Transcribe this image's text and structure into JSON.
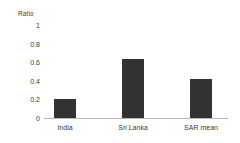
{
  "chart_data": {
    "type": "bar",
    "title": "",
    "subtitle": "",
    "xlabel": "",
    "ylabel": "Ratio",
    "categories": [
      "India",
      "Sri Lanka",
      "SAR mean"
    ],
    "values": [
      0.2,
      0.63,
      0.42
    ],
    "ylim": [
      0,
      1
    ],
    "yticks": [
      0,
      0.2,
      0.4,
      0.6,
      0.8,
      1
    ],
    "ytick_labels": [
      "0",
      "0.2",
      "0.4",
      "0.6",
      "0.8",
      "1"
    ],
    "grid": false,
    "legend": null,
    "legend_position": "none",
    "series": [
      {
        "name": "Ratio",
        "values": [
          0.2,
          0.63,
          0.42
        ]
      }
    ],
    "annotations": []
  },
  "style": {
    "bar_color": "#333333",
    "axis_color": "#b8b8b8",
    "text_color": "#3b3b3b",
    "background": "#ffffff"
  },
  "axis": {
    "y_title": "Ratio",
    "tick_0": "0",
    "tick_1": "0.2",
    "tick_2": "0.4",
    "tick_3": "0.6",
    "tick_4": "0.8",
    "tick_5": "1"
  },
  "categories": {
    "cat_0": "India",
    "cat_1": "Sri Lanka",
    "cat_2": "SAR mean"
  }
}
